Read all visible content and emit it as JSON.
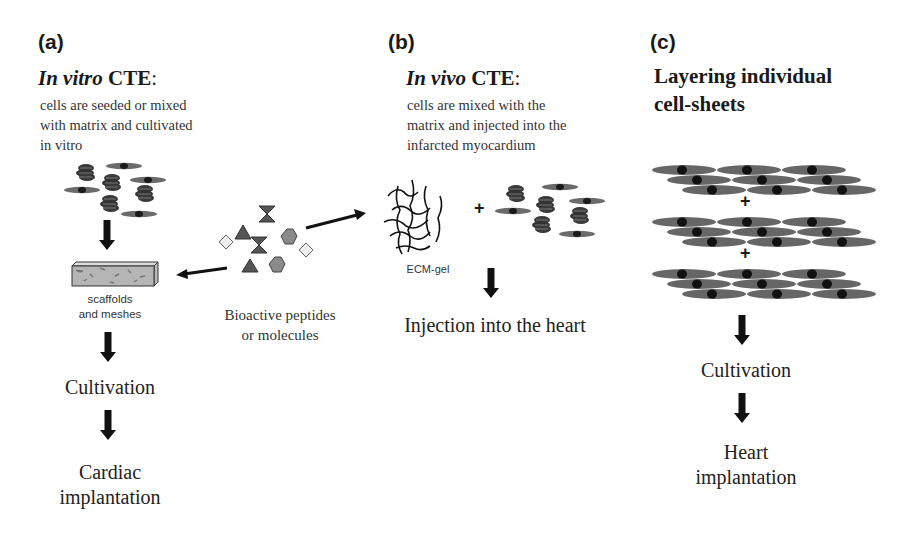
{
  "panels": {
    "a": {
      "label": "(a)",
      "title_italic": "In vitro",
      "title_rest": " CTE",
      "title_colon": ":",
      "description": [
        "cells are seeded or mixed",
        "with matrix and cultivated",
        "in vitro"
      ],
      "scaffold_label": [
        "scaffolds",
        "and meshes"
      ],
      "steps": [
        "Cultivation",
        "Cardiac",
        "implantation"
      ]
    },
    "b": {
      "label": "(b)",
      "title_italic": "In vivo",
      "title_rest": " CTE",
      "title_colon": ":",
      "description": [
        "cells are mixed with the",
        "matrix and injected into the",
        "infarcted myocardium"
      ],
      "gel_label": "ECM-gel",
      "plus": "+",
      "step": "Injection into the heart"
    },
    "c": {
      "label": "(c)",
      "title": [
        "Layering individual",
        "cell-sheets"
      ],
      "plus": [
        "+",
        "+"
      ],
      "steps": [
        "Cultivation",
        "Heart",
        "implantation"
      ]
    },
    "center": {
      "molecules_label": [
        "Bioactive peptides",
        "or molecules"
      ]
    }
  },
  "colors": {
    "cell_fill": "#6b6b6b",
    "cell_nucleus": "#1a1a1a",
    "cluster_fill": "#3a3a3a",
    "triangle": "#555555",
    "hexagon": "#8a8a8a",
    "diamond": "#e6e6e6",
    "arrow": "#111111"
  }
}
